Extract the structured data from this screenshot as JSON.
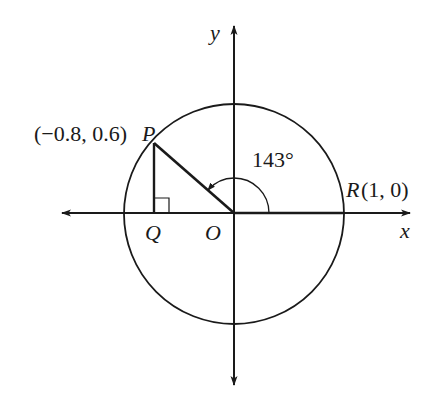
{
  "diagram": {
    "type": "unit-circle",
    "axes": {
      "x_label": "x",
      "y_label": "y"
    },
    "points": {
      "origin": {
        "label": "O"
      },
      "P": {
        "label": "P",
        "coords_text": "(−0.8, 0.6)",
        "x": -0.8,
        "y": 0.6
      },
      "Q": {
        "label": "Q"
      },
      "R": {
        "label": "R",
        "coords_text": "(1, 0)",
        "x": 1,
        "y": 0
      }
    },
    "angle": {
      "label": "143°",
      "degrees": 143
    },
    "colors": {
      "stroke": "#1a1a1a",
      "background": "#ffffff"
    }
  }
}
